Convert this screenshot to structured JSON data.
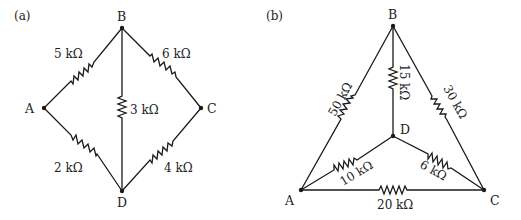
{
  "figure_a": {
    "label": "(a)",
    "nodes": {
      "A": {
        "name": "A",
        "x": 44,
        "y": 108
      },
      "B": {
        "name": "B",
        "x": 122,
        "y": 28
      },
      "C": {
        "name": "C",
        "x": 201,
        "y": 108
      },
      "D": {
        "name": "D",
        "x": 122,
        "y": 191
      }
    },
    "resistors": [
      {
        "from": "A",
        "to": "B",
        "value": "5 kΩ"
      },
      {
        "from": "B",
        "to": "C",
        "value": "6 kΩ"
      },
      {
        "from": "B",
        "to": "D",
        "value": "3 kΩ"
      },
      {
        "from": "A",
        "to": "D",
        "value": "2 kΩ"
      },
      {
        "from": "D",
        "to": "C",
        "value": "4 kΩ"
      }
    ]
  },
  "figure_b": {
    "label": "(b)",
    "nodes": {
      "A": {
        "name": "A",
        "x": 301,
        "y": 190
      },
      "B": {
        "name": "B",
        "x": 393,
        "y": 26
      },
      "C": {
        "name": "C",
        "x": 484,
        "y": 190
      },
      "D": {
        "name": "D",
        "x": 393,
        "y": 136
      }
    },
    "resistors": [
      {
        "from": "A",
        "to": "B",
        "value": "50 kΩ"
      },
      {
        "from": "B",
        "to": "D",
        "value": "15 kΩ"
      },
      {
        "from": "B",
        "to": "C",
        "value": "30 kΩ"
      },
      {
        "from": "A",
        "to": "D",
        "value": "10 kΩ"
      },
      {
        "from": "D",
        "to": "C",
        "value": "6 kΩ"
      },
      {
        "from": "A",
        "to": "C",
        "value": "20 kΩ"
      }
    ]
  },
  "colors": {
    "wire": "#1a1a1a",
    "text": "#222222",
    "background": "#ffffff"
  }
}
